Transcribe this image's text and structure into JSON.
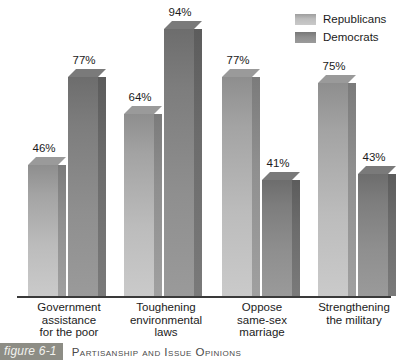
{
  "legend": {
    "items": [
      {
        "label": "Republicans",
        "series": "republicans",
        "color": "#bdbdbd"
      },
      {
        "label": "Democrats",
        "series": "democrats",
        "color": "#8e8e8e"
      }
    ]
  },
  "caption": {
    "tag": "figure 6-1",
    "text": "Partisanship and Issue Opinions",
    "tag_bg": "#8d8d85"
  },
  "chart_data": {
    "type": "bar",
    "title": "Partisanship and Issue Opinions",
    "xlabel": "",
    "ylabel": "",
    "ylim": [
      0,
      100
    ],
    "grid": false,
    "legend_position": "top-right",
    "value_suffix": "%",
    "categories": [
      "Government assistance for the poor",
      "Toughening environmental laws",
      "Oppose same-sex marriage",
      "Strengthening the military"
    ],
    "category_lines": [
      [
        "Government",
        "assistance",
        "for the poor"
      ],
      [
        "Toughening",
        "environmental",
        "laws"
      ],
      [
        "Oppose",
        "same-sex",
        "marriage"
      ],
      [
        "Strengthening",
        "the military"
      ]
    ],
    "series": [
      {
        "name": "Republicans",
        "color": "#bdbdbd",
        "values": [
          46,
          64,
          77,
          75
        ],
        "labels": [
          "46%",
          "64%",
          "77%",
          "75%"
        ]
      },
      {
        "name": "Democrats",
        "color": "#8e8e8e",
        "values": [
          77,
          94,
          41,
          43
        ],
        "labels": [
          "77%",
          "94%",
          "41%",
          "43%"
        ]
      }
    ]
  }
}
